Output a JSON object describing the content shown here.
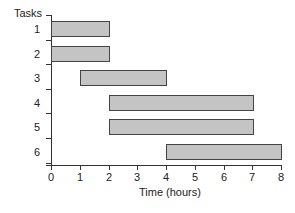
{
  "chart_data": {
    "type": "gantt",
    "title": "",
    "ylabel": "Tasks",
    "xlabel": "Time (hours)",
    "xlim": [
      0,
      8
    ],
    "xticks": [
      "0",
      "1",
      "2",
      "3",
      "4",
      "5",
      "6",
      "7",
      "8"
    ],
    "categories": [
      "1",
      "2",
      "3",
      "4",
      "5",
      "6"
    ],
    "tasks": [
      {
        "task": "1",
        "start": 0,
        "end": 2
      },
      {
        "task": "2",
        "start": 0,
        "end": 2
      },
      {
        "task": "3",
        "start": 1,
        "end": 4
      },
      {
        "task": "4",
        "start": 2,
        "end": 7
      },
      {
        "task": "5",
        "start": 2,
        "end": 7
      },
      {
        "task": "6",
        "start": 4,
        "end": 8
      }
    ],
    "grid": false,
    "legend": null,
    "colors": {
      "bar_fill": "#c4c4c4",
      "bar_edge": "#444444",
      "axis": "#333333"
    }
  }
}
